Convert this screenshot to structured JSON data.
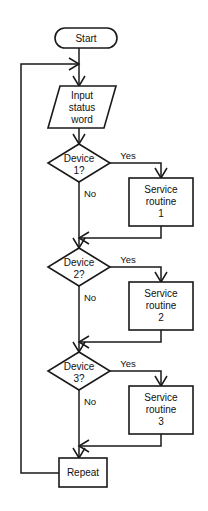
{
  "diagram": {
    "type": "flowchart",
    "background_color": "#ffffff",
    "line_color": "#1a1a1a",
    "nodes": {
      "start": {
        "label": "Start",
        "shape": "terminator"
      },
      "input": {
        "line1": "Input",
        "line2": "status",
        "line3": "word",
        "shape": "parallelogram"
      },
      "device1": {
        "line1": "Device",
        "line2": "1?",
        "shape": "decision"
      },
      "device2": {
        "line1": "Device",
        "line2": "2?",
        "shape": "decision"
      },
      "device3": {
        "line1": "Device",
        "line2": "3?",
        "shape": "decision"
      },
      "service1": {
        "line1": "Service",
        "line2": "routine",
        "line3": "1",
        "shape": "process"
      },
      "service2": {
        "line1": "Service",
        "line2": "routine",
        "line3": "2",
        "shape": "process"
      },
      "service3": {
        "line1": "Service",
        "line2": "routine",
        "line3": "3",
        "shape": "process"
      },
      "repeat": {
        "label": "Repeat",
        "shape": "process"
      }
    },
    "edge_labels": {
      "yes1": "Yes",
      "no1": "No",
      "yes2": "Yes",
      "no2": "No",
      "yes3": "Yes",
      "no3": "No"
    }
  }
}
